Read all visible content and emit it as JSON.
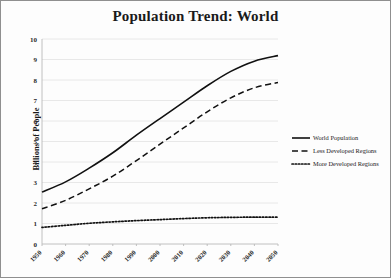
{
  "chart_data": {
    "type": "line",
    "title": "Population Trend: World",
    "xlabel": "",
    "ylabel": "Billions of People",
    "x": [
      1950,
      1960,
      1970,
      1980,
      1990,
      2000,
      2010,
      2020,
      2030,
      2040,
      2050
    ],
    "categories": [
      "1950",
      "1960",
      "1970",
      "1980",
      "1990",
      "2000",
      "2010",
      "2020",
      "2030",
      "2040",
      "2050"
    ],
    "xlim": [
      1950,
      2050
    ],
    "ylim": [
      0,
      10
    ],
    "yticks": [
      0,
      1,
      2,
      3,
      4,
      5,
      6,
      7,
      8,
      9,
      10
    ],
    "ytick_labels": [
      "0",
      "1",
      "2",
      "3",
      "4",
      "5",
      "6",
      "7",
      "8",
      "9",
      "10"
    ],
    "grid": "horizontal",
    "legend_position": "right",
    "series": [
      {
        "name": "World Population",
        "style": "solid",
        "color": "#111111",
        "values": [
          2.53,
          3.03,
          3.7,
          4.45,
          5.31,
          6.12,
          6.92,
          7.72,
          8.42,
          8.92,
          9.19
        ]
      },
      {
        "name": "Less Developed Regions",
        "style": "dashed",
        "color": "#111111",
        "values": [
          1.72,
          2.13,
          2.69,
          3.31,
          4.07,
          4.87,
          5.66,
          6.45,
          7.13,
          7.62,
          7.88
        ]
      },
      {
        "name": "More Developed Regions",
        "style": "dotted",
        "color": "#111111",
        "values": [
          0.81,
          0.91,
          1.01,
          1.08,
          1.14,
          1.19,
          1.24,
          1.28,
          1.3,
          1.31,
          1.31
        ]
      }
    ]
  },
  "plot_geometry": {
    "left": 41,
    "right": 277,
    "top": 38,
    "bottom": 243
  },
  "legend_geometry": {
    "x": 291,
    "y_start": 137,
    "row_height": 13,
    "sample_width": 18
  }
}
